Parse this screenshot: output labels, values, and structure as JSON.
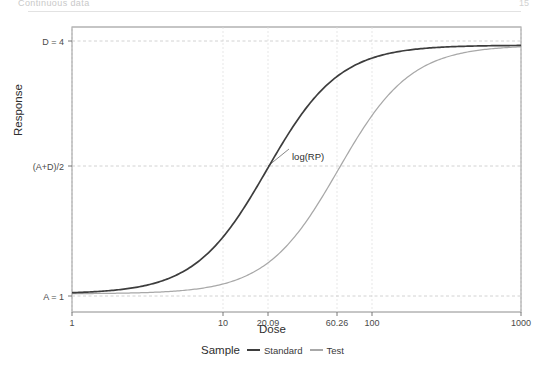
{
  "page": {
    "header_left": "Continuous data",
    "header_right": "15"
  },
  "figure": {
    "y_axis_title": "Response",
    "x_axis_title": "Dose",
    "annotation": "log(RP)"
  },
  "legend": {
    "title": "Sample",
    "entries": [
      {
        "label": "Standard",
        "color": "#3d3d3d"
      },
      {
        "label": "Test",
        "color": "#a8a8a8"
      }
    ]
  },
  "chart_data": {
    "type": "line",
    "title": "",
    "xlabel": "Dose",
    "ylabel": "Response",
    "x_scale": "log",
    "xlim": [
      1,
      1000
    ],
    "ylim": [
      0.78,
      4.22
    ],
    "grid": true,
    "legend_position": "bottom",
    "x_ticks": [
      {
        "value": 1,
        "label": "1"
      },
      {
        "value": 10,
        "label": "10"
      },
      {
        "value": 20.09,
        "label": "20.09"
      },
      {
        "value": 60.26,
        "label": "60.26"
      },
      {
        "value": 100,
        "label": "100"
      },
      {
        "value": 1000,
        "label": "1000"
      }
    ],
    "y_ticks": [
      {
        "value": 4,
        "label": "D = 4"
      },
      {
        "value": 2.5,
        "label": "(A+D)/2"
      },
      {
        "value": 1,
        "label": "A = 1"
      }
    ],
    "model": "4PL logistic: y = D + (A - D) / (1 + (x/C)^B)",
    "parameters": {
      "A": 1,
      "B": 1.8,
      "D": 4
    },
    "series": [
      {
        "name": "Standard",
        "color": "#3d3d3d",
        "ec50": 20.09,
        "x": [
          1,
          1.5,
          2.2,
          3.2,
          4.6,
          6.8,
          10,
          14,
          20.09,
          28,
          40,
          60.26,
          85,
          120,
          180,
          280,
          450,
          700,
          1000
        ],
        "y": [
          1.02,
          1.05,
          1.09,
          1.16,
          1.27,
          1.46,
          1.74,
          2.08,
          2.5,
          2.93,
          3.3,
          3.6,
          3.76,
          3.86,
          3.92,
          3.96,
          3.98,
          3.99,
          4.0
        ]
      },
      {
        "name": "Test",
        "color": "#a8a8a8",
        "ec50": 60.26,
        "x": [
          1,
          1.5,
          2.2,
          3.2,
          4.6,
          6.8,
          10,
          14,
          20.09,
          28,
          40,
          60.26,
          85,
          120,
          180,
          280,
          450,
          700,
          1000
        ],
        "y": [
          1.0,
          1.01,
          1.02,
          1.03,
          1.06,
          1.11,
          1.2,
          1.33,
          1.55,
          1.85,
          2.2,
          2.5,
          2.95,
          3.3,
          3.6,
          3.8,
          3.91,
          3.95,
          3.97
        ]
      }
    ],
    "annotations": [
      {
        "text": "log(RP)",
        "description": "horizontal distance between Standard and Test EC50 at response (A+D)/2",
        "from_x": 20.09,
        "to_x": 60.26,
        "y": 2.5
      }
    ]
  }
}
